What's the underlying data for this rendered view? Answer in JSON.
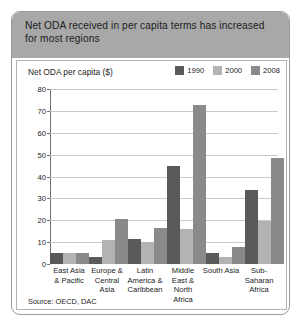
{
  "title": "Net ODA received in per capita terms has increased for most regions",
  "axis_title": "Net ODA per capita ($)",
  "source": "Source: OECD, DAC",
  "colors": {
    "series_1990": "#5a5a5a",
    "series_2000": "#b3b3b3",
    "series_2008": "#8a8a8a",
    "title_band": "#a8a8a8",
    "gridline": "#c9c9c9",
    "axis": "#6f6f6f",
    "border": "#9a9a9a"
  },
  "chart_data": {
    "type": "bar",
    "title": "Net ODA received in per capita terms has increased for most regions",
    "xlabel": "",
    "ylabel": "Net ODA per capita ($)",
    "ylim": [
      0,
      80
    ],
    "yticks": [
      0,
      10,
      20,
      30,
      40,
      50,
      60,
      70,
      80
    ],
    "grid": true,
    "legend_position": "top-right",
    "categories": [
      "East Asia & Pacific",
      "Europe & Central Asia",
      "Latin America & Caribbean",
      "Middle East & North Africa",
      "South Asia",
      "Sub-Saharan Africa"
    ],
    "series": [
      {
        "name": "1990",
        "color": "#5a5a5a",
        "values": [
          5,
          3,
          11.5,
          45,
          5,
          34
        ]
      },
      {
        "name": "2000",
        "color": "#b3b3b3",
        "values": [
          5,
          11,
          10,
          16,
          3,
          19.5
        ]
      },
      {
        "name": "2008",
        "color": "#8a8a8a",
        "values": [
          5,
          20.5,
          16.5,
          72.5,
          8,
          48.5
        ]
      }
    ]
  }
}
